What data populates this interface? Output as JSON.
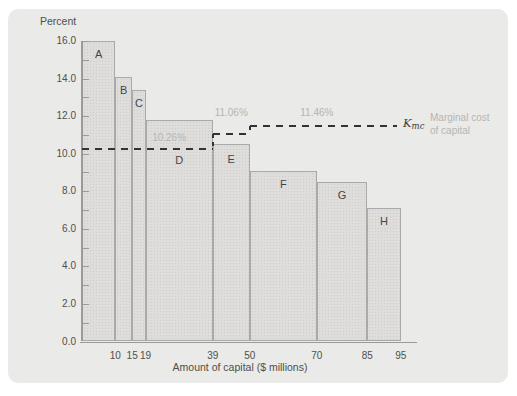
{
  "chart_data": {
    "type": "bar",
    "title": "",
    "ylabel": "Percent",
    "xlabel": "Amount of capital ($ millions)",
    "ylim": [
      0,
      16
    ],
    "xlim": [
      0,
      100
    ],
    "grid": false,
    "y_major_ticks": [
      0,
      2,
      4,
      6,
      8,
      10,
      12,
      14,
      16
    ],
    "y_tick_labels": [
      "0.0",
      "2.0",
      "4.0",
      "6.0",
      "8.0",
      "10.0",
      "12.0",
      "14.0",
      "16.0"
    ],
    "y_minor_step": 1,
    "x_ticks": [
      10,
      15,
      19,
      39,
      50,
      70,
      85,
      95
    ],
    "bars": [
      {
        "label": "A",
        "x_start": 0,
        "x_end": 10,
        "irr_percent": 16.0
      },
      {
        "label": "B",
        "x_start": 10,
        "x_end": 15,
        "irr_percent": 14.1
      },
      {
        "label": "C",
        "x_start": 15,
        "x_end": 19,
        "irr_percent": 13.4
      },
      {
        "label": "D",
        "x_start": 19,
        "x_end": 39,
        "irr_percent": 11.8
      },
      {
        "label": "E",
        "x_start": 39,
        "x_end": 50,
        "irr_percent": 10.5
      },
      {
        "label": "F",
        "x_start": 50,
        "x_end": 70,
        "irr_percent": 9.1
      },
      {
        "label": "G",
        "x_start": 70,
        "x_end": 85,
        "irr_percent": 8.5
      },
      {
        "label": "H",
        "x_start": 85,
        "x_end": 95,
        "irr_percent": 7.1
      }
    ],
    "mcc_steps": [
      {
        "rate_percent": 10.26,
        "x_start": 0,
        "x_end": 39,
        "label": "10.26%"
      },
      {
        "rate_percent": 11.06,
        "x_start": 39,
        "x_end": 50,
        "label": "11.06%"
      },
      {
        "rate_percent": 11.46,
        "x_start": 50,
        "x_end": 94,
        "label": "11.46%"
      }
    ],
    "line_label": {
      "main": "K",
      "sub": "mc"
    },
    "line_caption": "Marginal cost of capital",
    "legend_position": "right of dashed line end"
  },
  "colors": {
    "panel_bg": "#eaeae8",
    "bar_fill": "#dedddb",
    "bar_border": "#a9a9a7",
    "dashed_line": "#333331",
    "muted_label": "#b5b5b3",
    "text": "#4f4f4d",
    "axis": "#9a9a98"
  }
}
